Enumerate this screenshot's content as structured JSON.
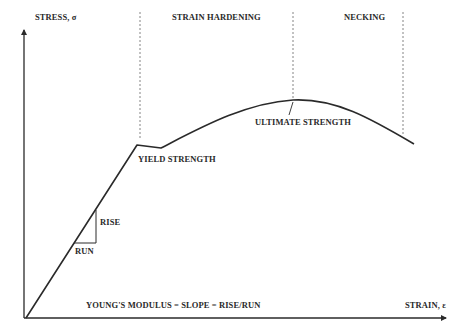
{
  "diagram": {
    "type": "stress-strain curve",
    "axes": {
      "y_label": "STRESS, σ",
      "x_label": "STRAIN, ε"
    },
    "regions": [
      {
        "label": "STRAIN HARDENING"
      },
      {
        "label": "NECKING"
      }
    ],
    "annotations": {
      "yield": "YIELD STRENGTH",
      "ultimate": "ULTIMATE STRENGTH",
      "rise": "RISE",
      "run": "RUN",
      "modulus": "YOUNG'S MODULUS = SLOPE = RISE/RUN"
    },
    "colors": {
      "line": "#2a2a2a",
      "dashed": "#777777",
      "background": "#ffffff"
    }
  }
}
